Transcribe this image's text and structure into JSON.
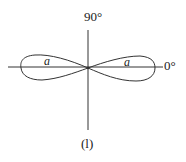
{
  "diagram": {
    "type": "polar radiation pattern",
    "shape": "figure-eight (two horizontal lobes)",
    "angle_labels": {
      "top": "90°",
      "right": "0°"
    },
    "lobe_labels": {
      "left": "a",
      "right": "a"
    },
    "caption": "(l)",
    "colors": {
      "stroke": "#333333",
      "text": "#222222",
      "background": "#ffffff"
    }
  }
}
